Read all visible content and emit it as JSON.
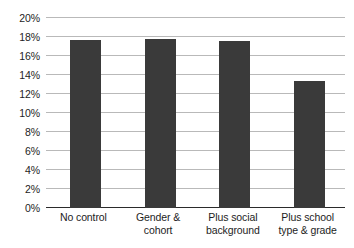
{
  "chart_data": {
    "type": "bar",
    "title": "",
    "subtitle": "",
    "xlabel": "",
    "ylabel": "",
    "categories": [
      "No control",
      "Gender & cohort",
      "Plus social background",
      "Plus school type & grade"
    ],
    "category_lines": [
      [
        "No control"
      ],
      [
        "Gender &",
        "cohort"
      ],
      [
        "Plus social",
        "background"
      ],
      [
        "Plus school",
        "type & grade"
      ]
    ],
    "values": [
      17.7,
      17.75,
      17.6,
      13.4
    ],
    "value_labels": [
      "17.7%",
      "17.8%",
      "17.6%",
      "13.4%"
    ],
    "ylim": [
      0,
      20
    ],
    "ytick_values": [
      0,
      2,
      4,
      6,
      8,
      10,
      12,
      14,
      16,
      18,
      20
    ],
    "ytick_labels": [
      "0%",
      "2%",
      "4%",
      "6%",
      "8%",
      "10%",
      "12%",
      "14%",
      "16%",
      "18%",
      "20%"
    ],
    "grid": true,
    "legend": false,
    "legend_position": "none",
    "bar_color": "#3a3a3a",
    "gridline_color": "#b9b9b9",
    "axis_color": "#2b2b2b",
    "background_color": "#ffffff"
  }
}
